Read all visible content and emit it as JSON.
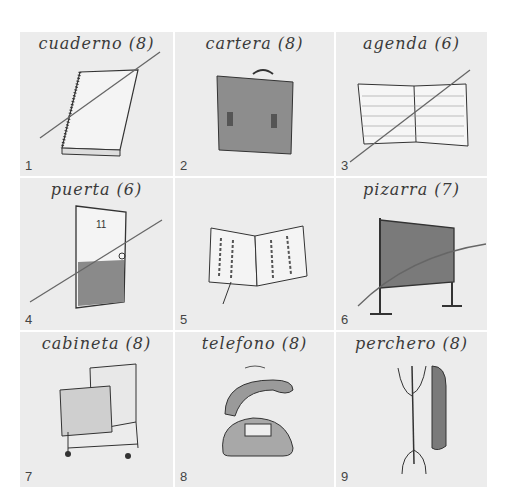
{
  "cells": [
    {
      "number": "1",
      "label": "cuaderno (8)",
      "item": "notebook",
      "crossed_out": true
    },
    {
      "number": "2",
      "label": "cartera (8)",
      "item": "briefcase",
      "crossed_out": false
    },
    {
      "number": "3",
      "label": "agenda (6)",
      "item": "planner",
      "crossed_out": true
    },
    {
      "number": "4",
      "label": "puerta (6)",
      "item": "door",
      "crossed_out": true
    },
    {
      "number": "5",
      "label": "",
      "item": "open-book",
      "crossed_out": false
    },
    {
      "number": "6",
      "label": "pizarra (7)",
      "item": "chalkboard",
      "crossed_out": true
    },
    {
      "number": "7",
      "label": "cabineta (8)",
      "item": "file-cabinet",
      "crossed_out": false
    },
    {
      "number": "8",
      "label": "telefono (8)",
      "item": "telephone",
      "crossed_out": false
    },
    {
      "number": "9",
      "label": "perchero (8)",
      "item": "coat-rack",
      "crossed_out": false
    }
  ],
  "door_number": "11",
  "colors": {
    "background": "#ececec",
    "ink": "#3a3a3a",
    "shade": "#8a8a8a"
  }
}
